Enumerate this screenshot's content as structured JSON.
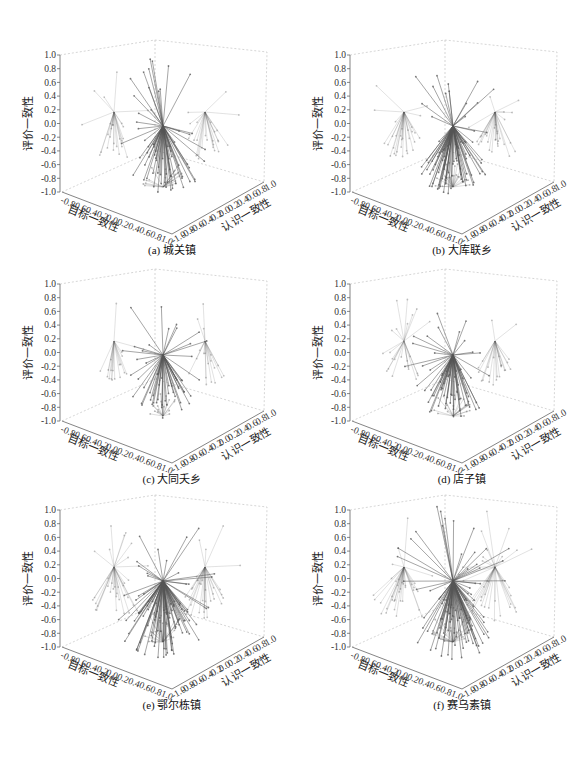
{
  "figure": {
    "background": "#ffffff",
    "vector_color": "#555555",
    "frame_color": "#bbbbbb"
  },
  "axes": {
    "z_label": "评价一致性",
    "x_label": "目标一致性",
    "y_label": "认识一致性",
    "z_ticks": [
      "1.0",
      "0.8",
      "0.6",
      "0.4",
      "0.2",
      "0.0",
      "-0.2",
      "-0.4",
      "-0.6",
      "-0.8",
      "-1.0"
    ],
    "x_ticks": [
      "-0.8",
      "-0.6",
      "-0.4",
      "-0.2",
      "0.0",
      "0.2",
      "0.4",
      "0.6",
      "0.8",
      "1.0"
    ],
    "y_ticks": [
      "-1.0",
      "-0.8",
      "-0.6",
      "-0.4",
      "-0.2",
      "0.0",
      "0.2",
      "0.4",
      "0.6",
      "0.8",
      "1.0"
    ]
  },
  "panels": [
    {
      "id": "a",
      "caption": "(a) 城关镇",
      "dx": 0,
      "dy": 0,
      "density": 70,
      "seed": 11,
      "spread": 1.0
    },
    {
      "id": "b",
      "caption": "(b) 大库联乡",
      "dx": 290,
      "dy": 0,
      "density": 85,
      "seed": 23,
      "spread": 1.0
    },
    {
      "id": "c",
      "caption": "(c) 大同夭乡",
      "dx": 0,
      "dy": 229,
      "density": 55,
      "seed": 37,
      "spread": 0.9
    },
    {
      "id": "d",
      "caption": "(d) 店子镇",
      "dx": 290,
      "dy": 229,
      "density": 65,
      "seed": 41,
      "spread": 0.95
    },
    {
      "id": "e",
      "caption": "(e) 鄂尔栋镇",
      "dx": 0,
      "dy": 455,
      "density": 95,
      "seed": 53,
      "spread": 1.1
    },
    {
      "id": "f",
      "caption": "(f) 赛乌素镇",
      "dx": 290,
      "dy": 455,
      "density": 100,
      "seed": 67,
      "spread": 1.15
    }
  ],
  "chart_data": [
    {
      "type": "3d-vector",
      "title": "(a) 城关镇",
      "xlabel": "目标一致性",
      "ylabel": "认识一致性",
      "zlabel": "评价一致性",
      "xlim": [
        -1,
        1
      ],
      "ylim": [
        -1,
        1
      ],
      "zlim": [
        -1,
        1
      ],
      "hubs": [
        {
          "name": "center",
          "x": 0,
          "y": 0,
          "z": 0
        },
        {
          "name": "left-projection",
          "z": 0.2
        },
        {
          "name": "right-projection",
          "z": 0.2
        },
        {
          "name": "bottom-projection",
          "z": -1.0
        }
      ]
    },
    {
      "type": "3d-vector",
      "title": "(b) 大库联乡",
      "xlabel": "目标一致性",
      "ylabel": "认识一致性",
      "zlabel": "评价一致性",
      "xlim": [
        -1,
        1
      ],
      "ylim": [
        -1,
        1
      ],
      "zlim": [
        -1,
        1
      ],
      "hubs": [
        {
          "name": "center",
          "x": 0,
          "y": 0,
          "z": 0
        },
        {
          "name": "left-projection",
          "z": 0.2
        },
        {
          "name": "right-projection",
          "z": 0.2
        },
        {
          "name": "bottom-projection",
          "z": -1.0
        }
      ]
    },
    {
      "type": "3d-vector",
      "title": "(c) 大同夭乡",
      "xlabel": "目标一致性",
      "ylabel": "认识一致性",
      "zlabel": "评价一致性",
      "xlim": [
        -1,
        1
      ],
      "ylim": [
        -1,
        1
      ],
      "zlim": [
        -1,
        1
      ],
      "hubs": [
        {
          "name": "center",
          "x": 0,
          "y": 0,
          "z": 0
        },
        {
          "name": "left-projection",
          "z": 0.2
        },
        {
          "name": "right-projection",
          "z": 0.2
        },
        {
          "name": "bottom-projection",
          "z": -1.0
        }
      ]
    },
    {
      "type": "3d-vector",
      "title": "(d) 店子镇",
      "xlabel": "目标一致性",
      "ylabel": "认识一致性",
      "zlabel": "评价一致性",
      "xlim": [
        -1,
        1
      ],
      "ylim": [
        -1,
        1
      ],
      "zlim": [
        -1,
        1
      ],
      "hubs": [
        {
          "name": "center",
          "x": 0,
          "y": 0,
          "z": 0
        },
        {
          "name": "left-projection",
          "z": 0.2
        },
        {
          "name": "right-projection",
          "z": 0.2
        },
        {
          "name": "bottom-projection",
          "z": -1.0
        }
      ]
    },
    {
      "type": "3d-vector",
      "title": "(e) 鄂尔栋镇",
      "xlabel": "目标一致性",
      "ylabel": "认识一致性",
      "zlabel": "评价一致性",
      "xlim": [
        -1,
        1
      ],
      "ylim": [
        -1,
        1
      ],
      "zlim": [
        -1,
        1
      ],
      "hubs": [
        {
          "name": "center",
          "x": 0,
          "y": 0,
          "z": 0
        },
        {
          "name": "left-projection",
          "z": 0.2
        },
        {
          "name": "right-projection",
          "z": 0.2
        },
        {
          "name": "bottom-projection",
          "z": -1.0
        }
      ]
    },
    {
      "type": "3d-vector",
      "title": "(f) 赛乌素镇",
      "xlabel": "目标一致性",
      "ylabel": "认识一致性",
      "zlabel": "评价一致性",
      "xlim": [
        -1,
        1
      ],
      "ylim": [
        -1,
        1
      ],
      "zlim": [
        -1,
        1
      ],
      "hubs": [
        {
          "name": "center",
          "x": 0,
          "y": 0,
          "z": 0
        },
        {
          "name": "left-projection",
          "z": 0.2
        },
        {
          "name": "right-projection",
          "z": 0.2
        },
        {
          "name": "bottom-projection",
          "z": -1.0
        }
      ]
    }
  ]
}
